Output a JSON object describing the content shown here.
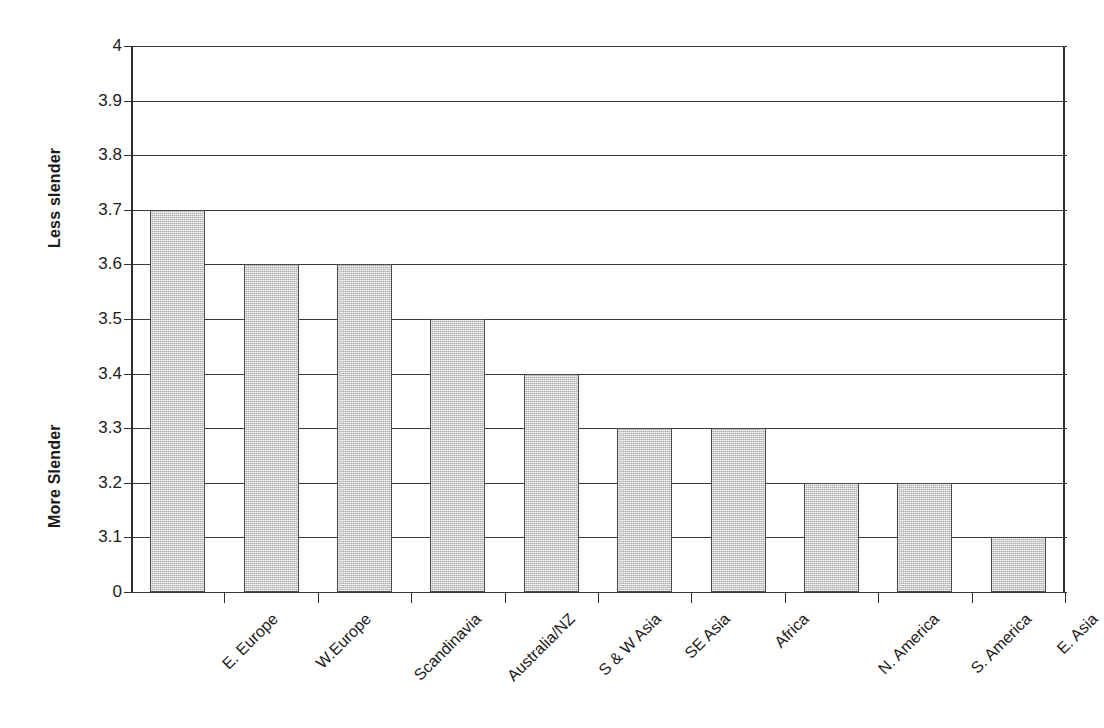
{
  "chart_data": {
    "type": "bar",
    "title": "",
    "xlabel": "",
    "ylabel": "",
    "categories": [
      "E. Europe",
      "W.Europe",
      "Scandinavia",
      "Australia/NZ",
      "S & W Asia",
      "SE Asia",
      "Africa",
      "N. America",
      "S. America",
      "E. Asia"
    ],
    "values": [
      3.7,
      3.6,
      3.6,
      3.5,
      3.4,
      3.3,
      3.3,
      3.2,
      3.2,
      3.1
    ],
    "ytick_labels": [
      "4",
      "3.9",
      "3.8",
      "3.7",
      "3.6",
      "3.5",
      "3.4",
      "3.3",
      "3.2",
      "3.1",
      "0"
    ],
    "ytick_values": [
      4,
      3.9,
      3.8,
      3.7,
      3.6,
      3.5,
      3.4,
      3.3,
      3.2,
      3.1,
      0
    ],
    "ylim": [
      3.0,
      4.0
    ],
    "axis_note": "broken axis: baseline labelled 0, ticks evenly spaced from 3.1 to 4",
    "grid": true,
    "legend": "none",
    "bar_color": "#cccccc",
    "bar_border_color": "#4a4a4a",
    "axis_color": "#2e2e2e",
    "y_axis_titles": {
      "upper": "Less slender",
      "lower": "More Slender"
    }
  }
}
